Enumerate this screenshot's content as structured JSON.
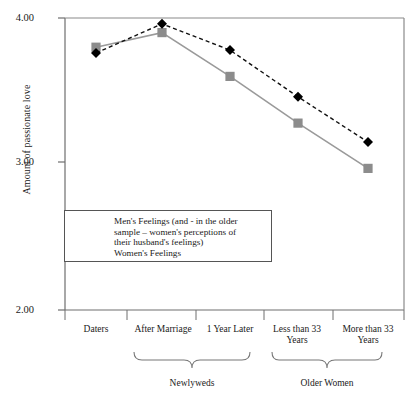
{
  "chart_data": {
    "type": "line",
    "title": "",
    "xlabel": "",
    "ylabel": "Amount of passionate love",
    "ylim": [
      2.0,
      4.0
    ],
    "yticks": [
      "2.00",
      "3.00",
      "4.00"
    ],
    "ytick_values": [
      2.0,
      3.0,
      4.0
    ],
    "grid": false,
    "legend_position": "inside-lower-left",
    "categories": [
      "Daters",
      "After Marriage",
      "1 Year Later",
      "Less than 33 Years",
      "More than 33 Years"
    ],
    "category_groups": [
      {
        "label": "Newlyweds",
        "categories": [
          "After Marriage",
          "1 Year Later"
        ]
      },
      {
        "label": "Older Women",
        "categories": [
          "Less than 33 Years",
          "More than 33 Years"
        ]
      }
    ],
    "series": [
      {
        "name": "Men's Feelings (and - in the older sample - women's perceptions of their husband's feelings)",
        "values": [
          3.76,
          3.96,
          3.78,
          3.46,
          3.15
        ],
        "color": "#000000",
        "marker": "diamond",
        "linestyle": "dashed"
      },
      {
        "name": "Women's Feelings",
        "values": [
          3.8,
          3.9,
          3.6,
          3.28,
          2.97
        ],
        "color": "#8c8c8c",
        "marker": "square",
        "linestyle": "solid"
      }
    ]
  },
  "axis": {
    "y_label": "Amount of passionate love",
    "y_tick_0": "2.00",
    "y_tick_1": "3.00",
    "y_tick_2": "4.00"
  },
  "xaxis": {
    "tick_0": "Daters",
    "tick_1": "After Marriage",
    "tick_2": "1 Year Later",
    "tick_3_line1": "Less than 33",
    "tick_3_line2": "Years",
    "tick_4_line1": "More than 33",
    "tick_4_line2": "Years",
    "group_0": "Newlyweds",
    "group_1": "Older Women"
  },
  "legend": {
    "men_label": "Men's Feelings (and - in the older\nsample – women's perceptions of\ntheir husband's feelings)",
    "women_label": "Women's Feelings"
  }
}
